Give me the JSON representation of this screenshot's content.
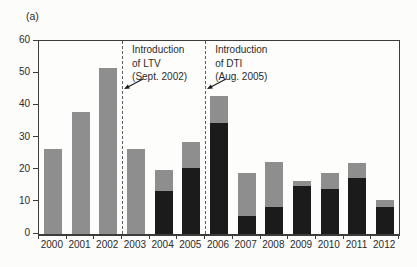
{
  "figure_label": "(a)",
  "colors": {
    "gray": "#8e8e8e",
    "black": "#1b1b1b",
    "axis": "#3c3c3c",
    "dashed_line": "#5f5f5f",
    "text": "#2b2b2b",
    "background": "#fcfcfb"
  },
  "chart_data": {
    "type": "bar",
    "stacked": true,
    "title": "",
    "xlabel": "",
    "ylabel": "",
    "categories": [
      "2000",
      "2001",
      "2002",
      "2003",
      "2004",
      "2005",
      "2006",
      "2007",
      "2008",
      "2009",
      "2010",
      "2011",
      "2012"
    ],
    "series": [
      {
        "name": "dark-segment",
        "color_key": "black",
        "values": [
          0,
          0,
          0,
          0,
          13.5,
          20.5,
          34.5,
          5.5,
          8.5,
          15,
          14,
          17.5,
          8.5
        ]
      },
      {
        "name": "gray-segment",
        "color_key": "gray",
        "values": [
          26.5,
          38,
          51.5,
          26.5,
          6.5,
          8,
          8.5,
          13.5,
          14,
          1.5,
          5,
          4.5,
          2
        ]
      }
    ],
    "totals": [
      26.5,
      38,
      51.5,
      26.5,
      20,
      28.5,
      43,
      19,
      22.5,
      16.5,
      19,
      22,
      10.5
    ],
    "ylim": [
      0,
      60
    ],
    "yticks": [
      0,
      10,
      20,
      30,
      40,
      50,
      60
    ],
    "grid": false,
    "legend": "none",
    "annotations": [
      {
        "id": "ltv",
        "lines": [
          "Introduction",
          "of LTV",
          "(Sept. 2002)"
        ],
        "line_between": [
          "2002",
          "2003"
        ]
      },
      {
        "id": "dti",
        "lines": [
          "Introduction",
          "of DTI",
          "(Aug. 2005)"
        ],
        "line_between": [
          "2005",
          "2006"
        ]
      }
    ]
  }
}
